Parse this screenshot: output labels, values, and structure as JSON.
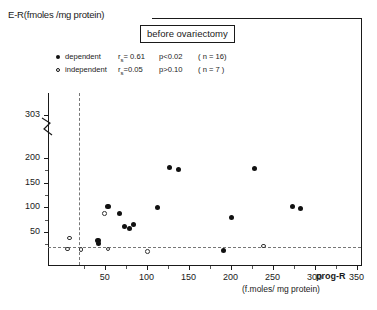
{
  "axes": {
    "y_label": "E-R(fmoles /mg protein)",
    "x_name": "prog-R",
    "x_unit": "(f.moles/ mg protein)",
    "y_ticks": [
      "303",
      "200",
      "150",
      "100",
      "50"
    ],
    "x_ticks": [
      "50",
      "100",
      "150",
      "200",
      "250",
      "300",
      "350",
      "400"
    ]
  },
  "title": {
    "text": "before ovariectomy"
  },
  "legend": {
    "rows": [
      {
        "marker": "filled",
        "name": "dependent",
        "stat_pre": "r",
        "stat_sub": "s",
        "stat_val": "= 0.61",
        "p": "p<0.02",
        "n": "( n = 16)"
      },
      {
        "marker": "open",
        "name": "independent",
        "stat_pre": "r",
        "stat_sub": "s",
        "stat_val": "=0.05",
        "p": "p>0.10",
        "n": "( n = 7 )"
      }
    ]
  },
  "chart_data": {
    "type": "scatter",
    "title": "before ovariectomy",
    "xlabel": "prog-R (f.moles/ mg protein)",
    "ylabel": "E-R(fmoles /mg protein)",
    "xlim": [
      0,
      430
    ],
    "ylim": [
      0,
      320
    ],
    "y_axis_break_between": [
      200,
      303
    ],
    "grid": false,
    "legend_position": "top-left",
    "reference_lines": [
      {
        "orientation": "vertical",
        "value": 37,
        "style": "dashed",
        "label": "prog-R threshold"
      },
      {
        "orientation": "horizontal",
        "value": 22,
        "style": "dashed",
        "label": "E-R threshold"
      }
    ],
    "series": [
      {
        "name": "dependent",
        "marker": "filled-circle",
        "n": 16,
        "r_s": 0.61,
        "p": "<0.02",
        "points": [
          {
            "x": 378,
            "y": 303
          },
          {
            "x": 127,
            "y": 180
          },
          {
            "x": 138,
            "y": 176
          },
          {
            "x": 229,
            "y": 178
          },
          {
            "x": 54,
            "y": 102
          },
          {
            "x": 113,
            "y": 100
          },
          {
            "x": 274,
            "y": 101
          },
          {
            "x": 283,
            "y": 98
          },
          {
            "x": 68,
            "y": 88
          },
          {
            "x": 201,
            "y": 79
          },
          {
            "x": 74,
            "y": 62
          },
          {
            "x": 84,
            "y": 66
          },
          {
            "x": 80,
            "y": 58
          },
          {
            "x": 42,
            "y": 33
          },
          {
            "x": 43,
            "y": 26
          },
          {
            "x": 192,
            "y": 12
          }
        ]
      },
      {
        "name": "independent",
        "marker": "open-circle",
        "n": 7,
        "r_s": 0.05,
        "p": ">0.10",
        "points": [
          {
            "x": 50,
            "y": 87
          },
          {
            "x": 8,
            "y": 38
          },
          {
            "x": 6,
            "y": 16
          },
          {
            "x": 22,
            "y": 15
          },
          {
            "x": 54,
            "y": 16
          },
          {
            "x": 101,
            "y": 10
          },
          {
            "x": 239,
            "y": 22
          }
        ]
      }
    ]
  }
}
